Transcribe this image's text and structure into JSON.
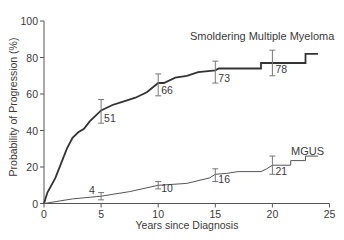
{
  "chart_data": {
    "type": "line",
    "title": "",
    "xlabel": "Years since Diagnosis",
    "ylabel": "Probability of Progression (%)",
    "xlim": [
      0,
      25
    ],
    "ylim": [
      0,
      100
    ],
    "x_ticks": [
      0,
      5,
      10,
      15,
      20,
      25
    ],
    "y_ticks": [
      0,
      20,
      40,
      60,
      80,
      100
    ],
    "grid": false,
    "legend": "inline labels",
    "series": [
      {
        "name": "Smoldering Multiple Myeloma",
        "style": "step",
        "color": "#333333",
        "points": [
          [
            0,
            0
          ],
          [
            0.3,
            6
          ],
          [
            1,
            14
          ],
          [
            1.5,
            22
          ],
          [
            2,
            30
          ],
          [
            2.5,
            36
          ],
          [
            3,
            39
          ],
          [
            3.5,
            41
          ],
          [
            4,
            45
          ],
          [
            4.5,
            48
          ],
          [
            5,
            51
          ],
          [
            6,
            54
          ],
          [
            7,
            56
          ],
          [
            8,
            58
          ],
          [
            9,
            61
          ],
          [
            10,
            66
          ],
          [
            10.5,
            66
          ],
          [
            11.5,
            69
          ],
          [
            12.5,
            70
          ],
          [
            13.5,
            72
          ],
          [
            15,
            73
          ],
          [
            15.3,
            74
          ],
          [
            19,
            74
          ],
          [
            19,
            77
          ],
          [
            20,
            77
          ],
          [
            22.9,
            77
          ],
          [
            22.9,
            82
          ],
          [
            24,
            82
          ]
        ],
        "annotations": [
          {
            "x": 5,
            "label": "51",
            "ci": [
              44,
              57
            ]
          },
          {
            "x": 10,
            "label": "66",
            "ci": [
              59,
              71
            ]
          },
          {
            "x": 15,
            "label": "73",
            "ci": [
              66,
              78
            ]
          },
          {
            "x": 20,
            "label": "78",
            "ci": [
              70,
              84
            ]
          }
        ]
      },
      {
        "name": "MGUS",
        "style": "step",
        "color": "#555555",
        "points": [
          [
            0,
            0
          ],
          [
            2.5,
            2.5
          ],
          [
            5,
            4
          ],
          [
            7.5,
            6.5
          ],
          [
            10,
            10
          ],
          [
            12.5,
            11
          ],
          [
            14.5,
            14
          ],
          [
            15,
            16
          ],
          [
            16,
            16.5
          ],
          [
            17,
            17.5
          ],
          [
            19,
            17.5
          ],
          [
            19.5,
            19
          ],
          [
            20,
            21
          ],
          [
            21.6,
            21
          ],
          [
            21.6,
            23.5
          ],
          [
            22.9,
            23.5
          ],
          [
            22.9,
            26
          ],
          [
            24,
            26
          ]
        ],
        "annotations": [
          {
            "x": 5,
            "label": "4",
            "ci": [
              2,
              6
            ]
          },
          {
            "x": 10,
            "label": "10",
            "ci": [
              8,
              12
            ]
          },
          {
            "x": 15,
            "label": "16",
            "ci": [
              12,
              19
            ]
          },
          {
            "x": 20,
            "label": "21",
            "ci": [
              16,
              26
            ]
          }
        ]
      }
    ]
  },
  "labels": {
    "smm": "Smoldering Multiple Myeloma",
    "mgus": "MGUS",
    "xlabel": "Years since Diagnosis",
    "ylabel": "Probability of Progression (%)"
  }
}
